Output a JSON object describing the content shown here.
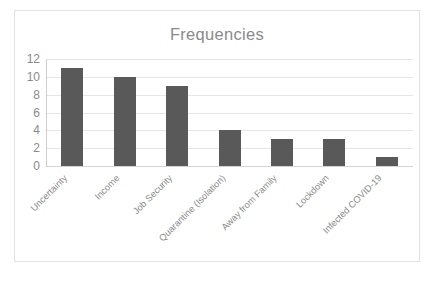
{
  "chart_data": {
    "type": "bar",
    "title": "Frequencies",
    "xlabel": "",
    "ylabel": "",
    "categories": [
      "Uncertainty",
      "Income",
      "Job Security",
      "Quarantine (Isolation)",
      "Away from Family",
      "Lockdown",
      "Infected COVID-19"
    ],
    "values": [
      11,
      10,
      9,
      4,
      3,
      3,
      1
    ],
    "ylim": [
      0,
      12
    ],
    "yticks": [
      "0",
      "2",
      "4",
      "6",
      "8",
      "10",
      "12"
    ],
    "ytick_values": [
      0,
      2,
      4,
      6,
      8,
      10,
      12
    ],
    "grid": true,
    "legend": false,
    "legend_position": "none",
    "colors": {
      "bar": "#595959",
      "gridline": "#e6e6e6",
      "axis": "#cfcfcf",
      "text": "#8a8a8a",
      "frame": "#e2e2e2",
      "background": "#ffffff"
    }
  }
}
